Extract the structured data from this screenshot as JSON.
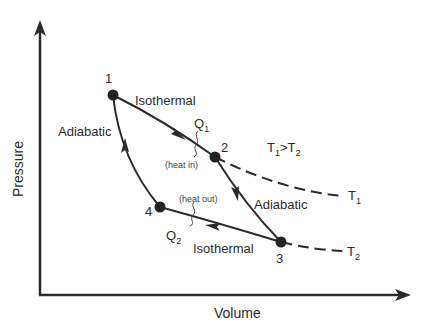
{
  "diagram": {
    "axes": {
      "x_label": "Volume",
      "y_label": "Pressure"
    },
    "points": [
      {
        "id": "1",
        "label": "1",
        "x": 113,
        "y": 95
      },
      {
        "id": "2",
        "label": "2",
        "x": 215,
        "y": 157
      },
      {
        "id": "3",
        "label": "3",
        "x": 281,
        "y": 242
      },
      {
        "id": "4",
        "label": "4",
        "x": 160,
        "y": 207
      }
    ],
    "processes": {
      "p12": "Isothermal",
      "p23": "Adiabatic",
      "p34": "Isothermal",
      "p41": "Adiabatic"
    },
    "heat": {
      "q1": "Q",
      "q1_sub": "1",
      "q1_note": "(heat in)",
      "q2": "Q",
      "q2_sub": "2",
      "q2_note": "(heat out)"
    },
    "isotherms": {
      "t1": "T",
      "t1_sub": "1",
      "t2": "T",
      "t2_sub": "2",
      "relation_a": "T",
      "relation_a_sub": "1",
      "relation_op": ">",
      "relation_b": "T",
      "relation_b_sub": "2"
    },
    "colors": {
      "line": "#2b2b2b",
      "background": "#ffffff"
    }
  }
}
